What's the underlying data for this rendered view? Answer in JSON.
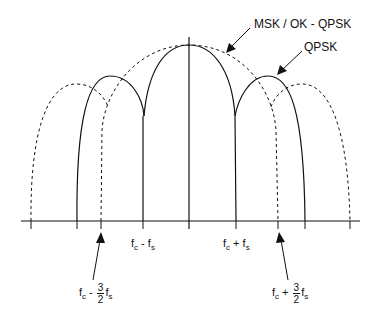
{
  "diagram": {
    "title": "",
    "type": "power spectral density comparison",
    "labels": {
      "msk": "MSK / OK - QPSK",
      "qpsk": "QPSK",
      "fc_minus_fs": {
        "f": "f",
        "c": "c",
        "op": " - ",
        "f2": "f",
        "s": "s"
      },
      "fc_plus_fs": {
        "f": "f",
        "c": "c",
        "op": " + ",
        "f2": "f",
        "s": "s"
      },
      "fc_minus_3_2_fs": {
        "f": "f",
        "c": "c",
        "op": " - ",
        "num": "3",
        "den": "2",
        "f2": "f",
        "s": "s"
      },
      "fc_plus_3_2_fs": {
        "f": "f",
        "c": "c",
        "op": " + ",
        "num": "3",
        "den": "2",
        "f2": "f",
        "s": "s"
      }
    },
    "series": [
      {
        "name": "QPSK",
        "style": "solid",
        "lobes": [
          [
            77,
            143
          ],
          [
            143,
            236
          ],
          [
            236,
            305
          ]
        ]
      },
      {
        "name": "MSK / OK - QPSK",
        "style": "dashed",
        "lobes": [
          [
            31,
            101
          ],
          [
            101,
            278
          ],
          [
            278,
            350
          ]
        ]
      }
    ],
    "colors": {
      "line": "#111111",
      "background": "#ffffff"
    }
  }
}
